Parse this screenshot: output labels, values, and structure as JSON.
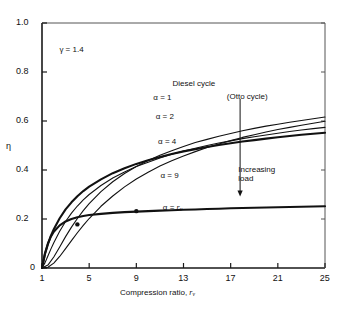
{
  "chart_data": {
    "type": "line",
    "title": "",
    "xlabel": "Compression ratio, r_v",
    "ylabel": "η",
    "xlim": [
      1,
      25
    ],
    "ylim": [
      0,
      1.0
    ],
    "xticks": [
      "1",
      "5",
      "9",
      "13",
      "17",
      "21",
      "25"
    ],
    "xtick_values": [
      1,
      5,
      9,
      13,
      17,
      21,
      25
    ],
    "yticks": [
      "0",
      "0.2",
      "0.4",
      "0.6",
      "0.8",
      "1.0"
    ],
    "ytick_values": [
      0,
      0.2,
      0.4,
      0.6,
      0.8,
      1.0
    ],
    "grid": false,
    "legend": "inline-curve-labels",
    "gamma": 1.4,
    "annotations": [
      {
        "name": "gamma-note",
        "text": "γ = 1.4",
        "x": 4.0,
        "y": 0.885
      },
      {
        "name": "family-title",
        "text": "Diesel cycle",
        "x": 13.6,
        "y": 0.745
      },
      {
        "name": "otto-note",
        "text": "(Otto cycle)",
        "x": 18.2,
        "y": 0.695
      },
      {
        "name": "increasing-load-note",
        "text": "Increasing load",
        "x": 18.5,
        "y": 0.395
      }
    ],
    "arrow": {
      "name": "increasing-load-arrow",
      "x": 17.8,
      "y_from": 0.69,
      "y_to": 0.3
    },
    "markers": [
      {
        "name": "intersection-alpha2",
        "x": 4.0,
        "y": 0.178
      },
      {
        "name": "intersection-alpha4",
        "x": 9.0,
        "y": 0.232
      }
    ],
    "series": [
      {
        "name": "alpha-1",
        "label": "α = 1",
        "label_x": 11.8,
        "label_y": 0.695,
        "emphasis": "thick",
        "x": [
          1,
          1.25,
          1.5,
          1.75,
          2,
          2.5,
          3,
          3.5,
          4,
          4.5,
          5,
          6,
          7,
          8,
          9,
          10,
          11,
          12,
          13,
          14,
          15,
          16,
          17,
          18,
          19,
          20,
          21,
          22,
          23,
          24,
          25
        ],
        "y": [
          0,
          0.056,
          0.097,
          0.131,
          0.158,
          0.203,
          0.239,
          0.268,
          0.293,
          0.314,
          0.332,
          0.362,
          0.387,
          0.407,
          0.425,
          0.44,
          0.453,
          0.465,
          0.476,
          0.485,
          0.494,
          0.502,
          0.509,
          0.516,
          0.522,
          0.528,
          0.534,
          0.539,
          0.544,
          0.548,
          0.552
        ]
      },
      {
        "name": "alpha-2",
        "label": "α = 2",
        "label_x": 12.0,
        "label_y": 0.615,
        "emphasis": "normal",
        "x": [
          1,
          1.25,
          1.5,
          1.75,
          2,
          2.5,
          3,
          3.5,
          4,
          4.5,
          5,
          6,
          7,
          8,
          9,
          10,
          11,
          12,
          13,
          14,
          15,
          16,
          17,
          18,
          19,
          20,
          21,
          22,
          23,
          24,
          25
        ],
        "y": [
          0,
          0.021,
          0.049,
          0.077,
          0.103,
          0.15,
          0.19,
          0.224,
          0.253,
          0.278,
          0.3,
          0.337,
          0.367,
          0.392,
          0.414,
          0.432,
          0.449,
          0.464,
          0.477,
          0.489,
          0.5,
          0.51,
          0.519,
          0.528,
          0.536,
          0.543,
          0.55,
          0.557,
          0.563,
          0.569,
          0.574
        ]
      },
      {
        "name": "alpha-4",
        "label": "α = 4",
        "label_x": 12.2,
        "label_y": 0.515,
        "emphasis": "normal",
        "x": [
          1,
          1.5,
          2,
          2.5,
          3,
          3.5,
          4,
          4.5,
          5,
          6,
          7,
          8,
          9,
          10,
          11,
          12,
          13,
          14,
          15,
          16,
          17,
          18,
          19,
          20,
          21,
          22,
          23,
          24,
          25
        ],
        "y": [
          0,
          0.012,
          0.045,
          0.086,
          0.128,
          0.167,
          0.202,
          0.234,
          0.263,
          0.312,
          0.352,
          0.386,
          0.414,
          0.439,
          0.46,
          0.479,
          0.496,
          0.512,
          0.525,
          0.538,
          0.549,
          0.56,
          0.57,
          0.579,
          0.587,
          0.595,
          0.602,
          0.609,
          0.616
        ]
      },
      {
        "name": "alpha-9",
        "label": "α = 9",
        "label_x": 12.4,
        "label_y": 0.375,
        "emphasis": "normal",
        "x": [
          1,
          1.5,
          2,
          2.5,
          3,
          3.5,
          4,
          4.5,
          5,
          6,
          7,
          8,
          9,
          10,
          11,
          12,
          13,
          14,
          15,
          16,
          17,
          18,
          19,
          20,
          21,
          22,
          23,
          24,
          25
        ],
        "y": [
          0,
          0.003,
          0.02,
          0.047,
          0.079,
          0.112,
          0.144,
          0.174,
          0.202,
          0.252,
          0.294,
          0.331,
          0.363,
          0.391,
          0.416,
          0.438,
          0.457,
          0.475,
          0.492,
          0.506,
          0.52,
          0.533,
          0.544,
          0.555,
          0.565,
          0.574,
          0.583,
          0.591,
          0.599
        ]
      },
      {
        "name": "alpha-rv",
        "label": "α = r_v",
        "label_x": 12.6,
        "label_y": 0.245,
        "emphasis": "thick",
        "x": [
          1,
          1.25,
          1.5,
          1.75,
          2,
          2.5,
          3,
          3.5,
          4,
          4.5,
          5,
          6,
          7,
          8,
          9,
          10,
          11,
          12,
          13,
          14,
          15,
          16,
          17,
          18,
          19,
          20,
          21,
          22,
          23,
          24,
          25
        ],
        "y": [
          0,
          0.06,
          0.1,
          0.128,
          0.148,
          0.174,
          0.19,
          0.2,
          0.207,
          0.212,
          0.216,
          0.221,
          0.225,
          0.228,
          0.23,
          0.232,
          0.234,
          0.236,
          0.238,
          0.239,
          0.241,
          0.242,
          0.244,
          0.245,
          0.246,
          0.247,
          0.248,
          0.249,
          0.25,
          0.251,
          0.252
        ]
      }
    ]
  },
  "labels": {
    "y_axis_symbol": "η",
    "x_axis_prefix": "Compression ratio, ",
    "x_axis_var": "r",
    "x_axis_sub": "v",
    "alpha_rv_prefix": "α = ",
    "alpha_rv_var": "r",
    "alpha_rv_sub": "v",
    "increasing_line1": "Increasing",
    "increasing_line2": "load"
  },
  "style": {
    "axis_color": "#1a1a1a",
    "curve_color": "#111111",
    "background": "#ffffff"
  }
}
